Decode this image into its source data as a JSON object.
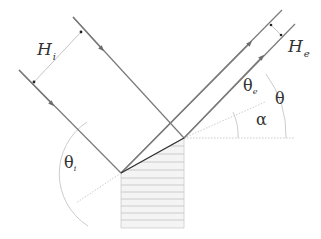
{
  "diagram": {
    "type": "ray-reflection-geometry",
    "labels": {
      "incident_width": "H",
      "incident_width_sub": "i",
      "exit_width": "H",
      "exit_width_sub": "e",
      "theta_i": "θ",
      "theta_i_sub": "i",
      "theta_e": "θ",
      "theta_e_sub": "e",
      "theta": "θ",
      "alpha": "α"
    },
    "colors": {
      "ray": "#7a7a7a",
      "surface": "#333333",
      "construction": "#c8c8c8",
      "hatch": "#bdbdbd",
      "block_fill": "#f4f4f4",
      "text": "#333333"
    }
  }
}
